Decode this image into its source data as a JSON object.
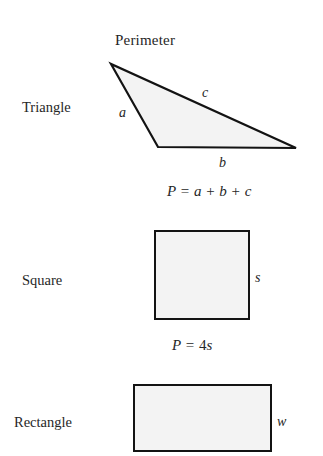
{
  "title": "Perimeter",
  "rows": [
    {
      "shape_label": "Triangle",
      "figure": "triangle",
      "side_labels": [
        {
          "name": "a",
          "text": "a"
        },
        {
          "name": "b",
          "text": "b"
        },
        {
          "name": "c",
          "text": "c"
        }
      ],
      "formula": {
        "lhs": "P",
        "equals": "=",
        "terms": [
          "a",
          "b",
          "c"
        ],
        "operators": [
          "+",
          "+"
        ],
        "full_text": "P = a + b + c"
      }
    },
    {
      "shape_label": "Square",
      "figure": "square",
      "side_labels": [
        {
          "name": "s",
          "text": "s"
        }
      ],
      "formula": {
        "lhs": "P",
        "equals": "=",
        "coefficient": "4",
        "terms": [
          "s"
        ],
        "full_text": "P = 4s"
      }
    },
    {
      "shape_label": "Rectangle",
      "figure": "rectangle",
      "side_labels": [
        {
          "name": "w",
          "text": "w"
        }
      ],
      "formula": null
    }
  ],
  "colors": {
    "shape_fill": "#f3f3f3",
    "shape_outline": "#131313",
    "text": "#262626",
    "background": "#ffffff"
  }
}
